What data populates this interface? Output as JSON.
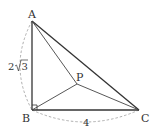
{
  "figure": {
    "type": "geometry",
    "points": {
      "A": {
        "label": "A",
        "x": 32,
        "y": 21
      },
      "B": {
        "label": "B",
        "x": 32,
        "y": 110
      },
      "C": {
        "label": "C",
        "x": 139,
        "y": 110
      },
      "P": {
        "label": "P",
        "x": 77,
        "y": 84
      }
    },
    "segments": [
      {
        "from": "A",
        "to": "B"
      },
      {
        "from": "B",
        "to": "C"
      },
      {
        "from": "A",
        "to": "C"
      },
      {
        "from": "A",
        "to": "P"
      },
      {
        "from": "B",
        "to": "P"
      },
      {
        "from": "C",
        "to": "P"
      }
    ],
    "measurements": {
      "AB": {
        "text": "2√3",
        "prefix": "2",
        "radicand": "3"
      },
      "BC": {
        "text": "4"
      }
    },
    "right_angle_at": "B",
    "colors": {
      "stroke": "#333333",
      "dashed": "#999999",
      "background": "#ffffff"
    }
  }
}
